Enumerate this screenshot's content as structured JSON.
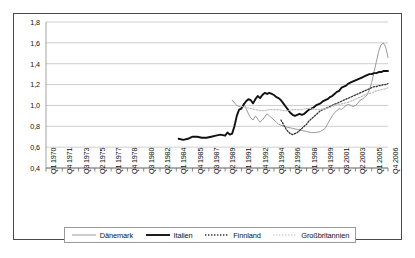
{
  "chart_data": {
    "type": "line",
    "title": "",
    "xlabel": "",
    "ylabel": "",
    "ylim": [
      0.4,
      1.8
    ],
    "ytick_step": 0.2,
    "grid": true,
    "legend_position": "bottom",
    "ytick_labels": [
      "1,8",
      "1,6",
      "1,4",
      "1,2",
      "1,0",
      "0,8",
      "0,6",
      "0,4"
    ],
    "ytick_values": [
      1.8,
      1.6,
      1.4,
      1.2,
      1.0,
      0.8,
      0.6,
      0.4
    ],
    "xtick_labels": [
      "Q1 1970",
      "Q4 1971",
      "Q3 1973",
      "Q2 1975",
      "Q1 1977",
      "Q4 1978",
      "Q3 1980",
      "Q2 1982",
      "Q1 1984",
      "Q4 1985",
      "Q3 1987",
      "Q2 1989",
      "Q1 1991",
      "Q4 1992",
      "Q3 1994",
      "Q2 1996",
      "Q1 1998",
      "Q4 1999",
      "Q3 2001",
      "Q2 2003",
      "Q1 2005",
      "Q4 2006"
    ],
    "x_range_quarters": [
      0,
      147
    ],
    "series": [
      {
        "name": "Dänemark",
        "color": "#9a9a9a",
        "style": "solid",
        "width": 1.0,
        "start_quarter": 80,
        "points": [
          [
            80,
            1.05
          ],
          [
            82,
            1.0
          ],
          [
            84,
            0.98
          ],
          [
            85,
            1.02
          ],
          [
            86,
            0.97
          ],
          [
            87,
            0.92
          ],
          [
            88,
            0.88
          ],
          [
            89,
            0.86
          ],
          [
            90,
            0.9
          ],
          [
            91,
            0.87
          ],
          [
            92,
            0.84
          ],
          [
            93,
            0.86
          ],
          [
            94,
            0.89
          ],
          [
            95,
            0.92
          ],
          [
            96,
            0.9
          ],
          [
            97,
            0.88
          ],
          [
            98,
            0.86
          ],
          [
            99,
            0.84
          ],
          [
            100,
            0.82
          ],
          [
            102,
            0.8
          ],
          [
            104,
            0.79
          ],
          [
            106,
            0.78
          ],
          [
            108,
            0.77
          ],
          [
            110,
            0.76
          ],
          [
            112,
            0.75
          ],
          [
            114,
            0.74
          ],
          [
            116,
            0.74
          ],
          [
            118,
            0.75
          ],
          [
            120,
            0.78
          ],
          [
            121,
            0.82
          ],
          [
            122,
            0.86
          ],
          [
            123,
            0.9
          ],
          [
            124,
            0.93
          ],
          [
            125,
            0.95
          ],
          [
            126,
            0.97
          ],
          [
            127,
            0.96
          ],
          [
            128,
            0.98
          ],
          [
            129,
            1.0
          ],
          [
            130,
            1.01
          ],
          [
            131,
            1.0
          ],
          [
            132,
            0.99
          ],
          [
            133,
            1.0
          ],
          [
            134,
            1.02
          ],
          [
            135,
            1.05
          ],
          [
            136,
            1.06
          ],
          [
            137,
            1.08
          ],
          [
            138,
            1.1
          ],
          [
            139,
            1.15
          ],
          [
            140,
            1.22
          ],
          [
            141,
            1.32
          ],
          [
            142,
            1.42
          ],
          [
            143,
            1.52
          ],
          [
            144,
            1.58
          ],
          [
            145,
            1.6
          ],
          [
            146,
            1.56
          ],
          [
            147,
            1.46
          ]
        ]
      },
      {
        "name": "Italien",
        "color": "#111111",
        "style": "solid",
        "width": 1.9,
        "start_quarter": 57,
        "points": [
          [
            57,
            0.68
          ],
          [
            59,
            0.67
          ],
          [
            61,
            0.68
          ],
          [
            63,
            0.7
          ],
          [
            65,
            0.7
          ],
          [
            67,
            0.69
          ],
          [
            69,
            0.69
          ],
          [
            71,
            0.7
          ],
          [
            73,
            0.71
          ],
          [
            75,
            0.72
          ],
          [
            77,
            0.71
          ],
          [
            78,
            0.74
          ],
          [
            79,
            0.72
          ],
          [
            80,
            0.73
          ],
          [
            81,
            0.8
          ],
          [
            82,
            0.9
          ],
          [
            83,
            0.96
          ],
          [
            84,
            0.97
          ],
          [
            85,
            1.01
          ],
          [
            86,
            1.04
          ],
          [
            87,
            1.06
          ],
          [
            88,
            1.05
          ],
          [
            89,
            1.02
          ],
          [
            90,
            1.06
          ],
          [
            91,
            1.09
          ],
          [
            92,
            1.07
          ],
          [
            93,
            1.1
          ],
          [
            94,
            1.12
          ],
          [
            95,
            1.11
          ],
          [
            96,
            1.12
          ],
          [
            97,
            1.11
          ],
          [
            98,
            1.1
          ],
          [
            99,
            1.08
          ],
          [
            100,
            1.07
          ],
          [
            101,
            1.05
          ],
          [
            102,
            1.02
          ],
          [
            103,
            0.99
          ],
          [
            104,
            0.96
          ],
          [
            105,
            0.93
          ],
          [
            106,
            0.91
          ],
          [
            107,
            0.9
          ],
          [
            108,
            0.91
          ],
          [
            109,
            0.92
          ],
          [
            110,
            0.91
          ],
          [
            111,
            0.92
          ],
          [
            112,
            0.94
          ],
          [
            113,
            0.96
          ],
          [
            114,
            0.97
          ],
          [
            115,
            0.98
          ],
          [
            116,
            1.0
          ],
          [
            117,
            1.01
          ],
          [
            118,
            1.02
          ],
          [
            119,
            1.04
          ],
          [
            120,
            1.05
          ],
          [
            121,
            1.06
          ],
          [
            122,
            1.08
          ],
          [
            123,
            1.09
          ],
          [
            124,
            1.11
          ],
          [
            125,
            1.13
          ],
          [
            126,
            1.14
          ],
          [
            127,
            1.17
          ],
          [
            128,
            1.18
          ],
          [
            129,
            1.19
          ],
          [
            130,
            1.21
          ],
          [
            131,
            1.22
          ],
          [
            132,
            1.23
          ],
          [
            133,
            1.24
          ],
          [
            134,
            1.25
          ],
          [
            135,
            1.26
          ],
          [
            136,
            1.27
          ],
          [
            137,
            1.28
          ],
          [
            138,
            1.29
          ],
          [
            139,
            1.3
          ],
          [
            140,
            1.3
          ],
          [
            141,
            1.31
          ],
          [
            142,
            1.31
          ],
          [
            143,
            1.32
          ],
          [
            144,
            1.32
          ],
          [
            145,
            1.33
          ],
          [
            146,
            1.33
          ],
          [
            147,
            1.33
          ]
        ]
      },
      {
        "name": "Finnland",
        "color": "#333333",
        "style": "dotted",
        "width": 1.3,
        "start_quarter": 101,
        "points": [
          [
            101,
            0.86
          ],
          [
            102,
            0.82
          ],
          [
            103,
            0.78
          ],
          [
            104,
            0.75
          ],
          [
            105,
            0.73
          ],
          [
            106,
            0.72
          ],
          [
            107,
            0.73
          ],
          [
            108,
            0.74
          ],
          [
            109,
            0.76
          ],
          [
            110,
            0.78
          ],
          [
            111,
            0.8
          ],
          [
            112,
            0.82
          ],
          [
            113,
            0.85
          ],
          [
            114,
            0.87
          ],
          [
            115,
            0.89
          ],
          [
            116,
            0.91
          ],
          [
            117,
            0.93
          ],
          [
            118,
            0.95
          ],
          [
            119,
            0.96
          ],
          [
            120,
            0.97
          ],
          [
            121,
            0.98
          ],
          [
            122,
            0.99
          ],
          [
            123,
            1.0
          ],
          [
            124,
            1.01
          ],
          [
            125,
            1.02
          ],
          [
            126,
            1.03
          ],
          [
            127,
            1.04
          ],
          [
            128,
            1.05
          ],
          [
            129,
            1.06
          ],
          [
            130,
            1.07
          ],
          [
            131,
            1.08
          ],
          [
            132,
            1.09
          ],
          [
            133,
            1.1
          ],
          [
            134,
            1.11
          ],
          [
            135,
            1.12
          ],
          [
            136,
            1.13
          ],
          [
            137,
            1.14
          ],
          [
            138,
            1.15
          ],
          [
            139,
            1.16
          ],
          [
            140,
            1.17
          ],
          [
            141,
            1.18
          ],
          [
            142,
            1.18
          ],
          [
            143,
            1.19
          ],
          [
            144,
            1.19
          ],
          [
            145,
            1.2
          ],
          [
            146,
            1.2
          ],
          [
            147,
            1.21
          ]
        ]
      },
      {
        "name": "Großbritannien",
        "color": "#bdbdbd",
        "style": "dotted",
        "width": 1.2,
        "start_quarter": 84,
        "points": [
          [
            84,
            0.99
          ],
          [
            86,
            0.98
          ],
          [
            88,
            0.97
          ],
          [
            90,
            0.96
          ],
          [
            92,
            0.95
          ],
          [
            94,
            0.95
          ],
          [
            96,
            0.96
          ],
          [
            98,
            0.96
          ],
          [
            100,
            0.96
          ],
          [
            102,
            0.95
          ],
          [
            104,
            0.95
          ],
          [
            106,
            0.96
          ],
          [
            108,
            0.96
          ],
          [
            110,
            0.96
          ],
          [
            112,
            0.97
          ],
          [
            114,
            0.97
          ],
          [
            116,
            0.96
          ],
          [
            118,
            0.96
          ],
          [
            120,
            0.97
          ],
          [
            122,
            0.98
          ],
          [
            124,
            1.0
          ],
          [
            126,
            1.01
          ],
          [
            128,
            1.02
          ],
          [
            130,
            1.03
          ],
          [
            132,
            1.05
          ],
          [
            134,
            1.07
          ],
          [
            136,
            1.09
          ],
          [
            138,
            1.11
          ],
          [
            140,
            1.12
          ],
          [
            142,
            1.14
          ],
          [
            144,
            1.15
          ],
          [
            146,
            1.16
          ],
          [
            147,
            1.17
          ]
        ]
      }
    ]
  },
  "legend": {
    "items": [
      {
        "label": "Dänemark"
      },
      {
        "label": "Italien"
      },
      {
        "label": "Finnland"
      },
      {
        "label": "Großbritannien"
      }
    ]
  }
}
